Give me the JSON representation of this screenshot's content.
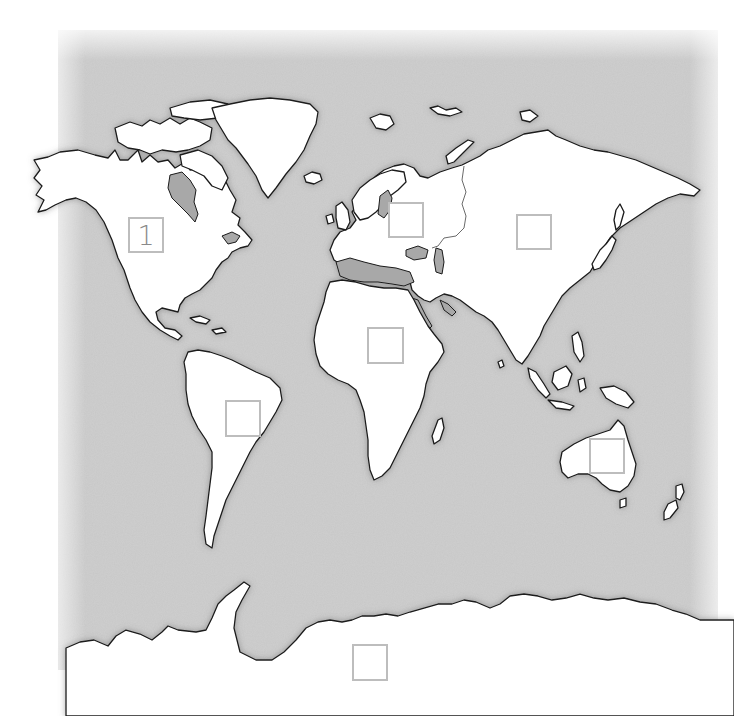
{
  "map": {
    "title": "World continents labeling worksheet",
    "colors": {
      "land": "#ffffff",
      "ocean_texture": "#c9c9c9",
      "coastline": "#1a1a1a",
      "inland_water": "#a8a8a8",
      "box_border": "#bdbdbd",
      "box_text": "#8a8a8a"
    },
    "label_boxes": [
      {
        "id": "north-america",
        "region": "North America",
        "value": "1",
        "x": 128,
        "y": 217,
        "w": 36,
        "h": 36
      },
      {
        "id": "europe",
        "region": "Europe",
        "value": "",
        "x": 388,
        "y": 202,
        "w": 36,
        "h": 36
      },
      {
        "id": "asia",
        "region": "Asia",
        "value": "",
        "x": 516,
        "y": 214,
        "w": 36,
        "h": 36
      },
      {
        "id": "africa",
        "region": "Africa",
        "value": "",
        "x": 367,
        "y": 327,
        "w": 37,
        "h": 37
      },
      {
        "id": "south-america",
        "region": "South America",
        "value": "",
        "x": 225,
        "y": 400,
        "w": 36,
        "h": 37
      },
      {
        "id": "australia",
        "region": "Australia",
        "value": "",
        "x": 589,
        "y": 438,
        "w": 36,
        "h": 36
      },
      {
        "id": "antarctica",
        "region": "Antarctica",
        "value": "",
        "x": 352,
        "y": 644,
        "w": 36,
        "h": 37
      }
    ]
  }
}
